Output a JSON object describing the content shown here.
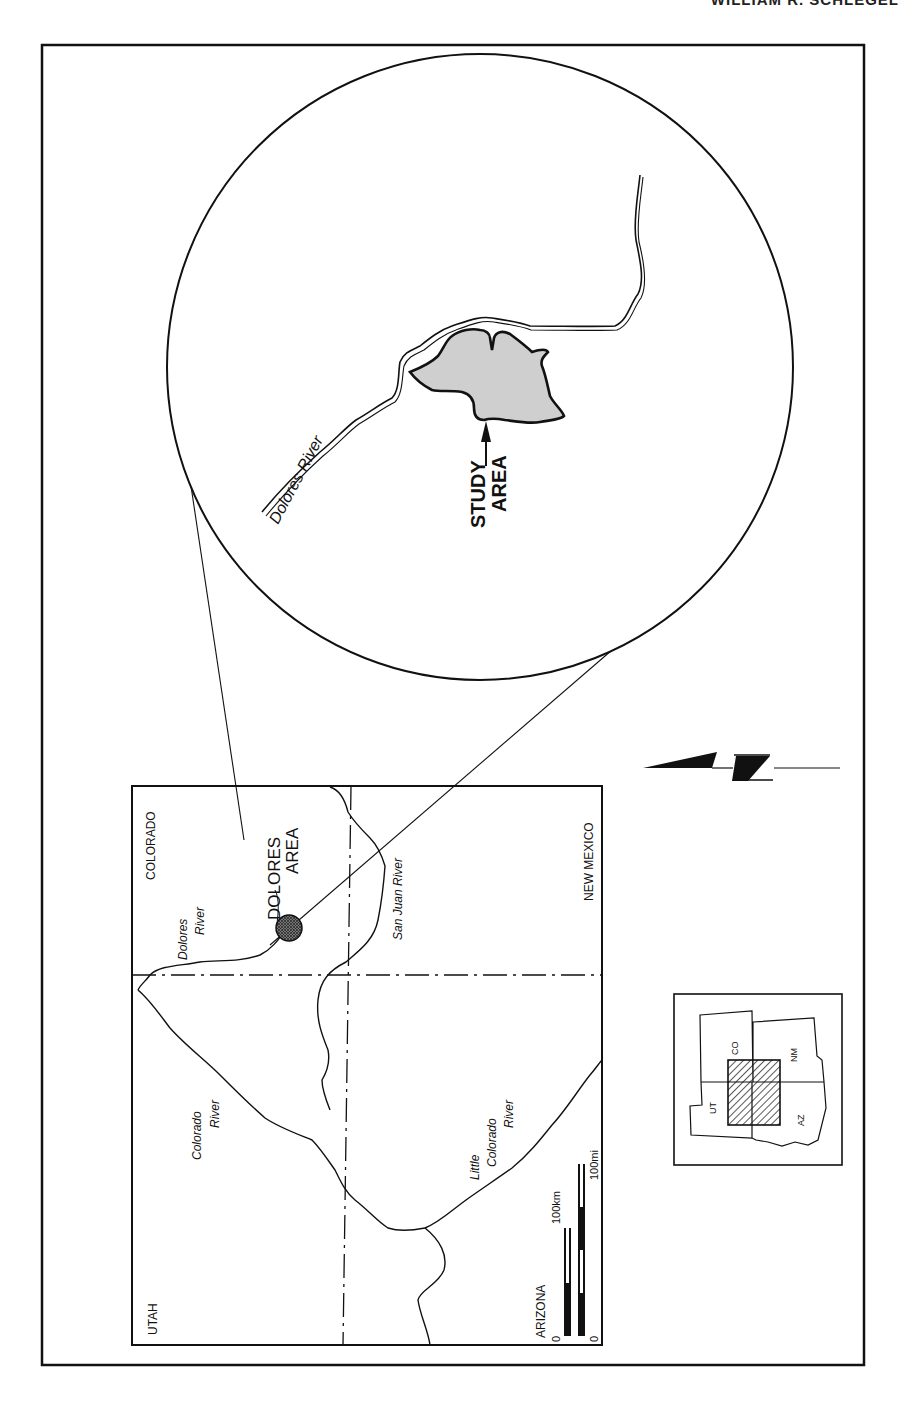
{
  "header": {
    "running_head": "WILLIAM R. SCHLEGEL"
  },
  "figure": {
    "colors": {
      "ink": "#111111",
      "study_fill": "#cfcfcf",
      "paper": "#ffffff"
    },
    "enlarged_view": {
      "river_label": "Dolores River",
      "study_label_line1": "STUDY",
      "study_label_line2": "AREA"
    },
    "regional_map": {
      "states": {
        "colorado": "COLORADO",
        "utah": "UTAH",
        "arizona": "ARIZONA",
        "new_mexico": "NEW MEXICO"
      },
      "rivers": {
        "dolores_l1": "Dolores",
        "dolores_l2": "River",
        "san_juan": "San Juan River",
        "colorado_l1": "Colorado",
        "colorado_l2": "River",
        "little_colorado_l1": "Little",
        "little_colorado_l2": "Colorado",
        "little_colorado_l3": "River"
      },
      "area_label_l1": "DOLORES",
      "area_label_l2": "AREA",
      "scale": {
        "km_zero": "0",
        "km_label": "100km",
        "mi_zero": "0",
        "mi_label": "100mi"
      }
    },
    "north_arrow": {
      "letter": "N"
    },
    "locator_map": {
      "states": {
        "co": "CO",
        "nm": "NM",
        "ut": "UT",
        "az": "AZ"
      }
    }
  }
}
